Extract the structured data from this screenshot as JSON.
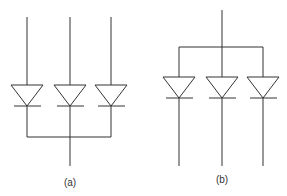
{
  "figure": {
    "colors": {
      "line": "#333333",
      "background": "#ffffff"
    },
    "panels": [
      {
        "id": "a",
        "label": "(a)",
        "configuration": "common-cathode",
        "diode_count": 3
      },
      {
        "id": "b",
        "label": "(b)",
        "configuration": "common-anode",
        "diode_count": 3
      }
    ]
  }
}
